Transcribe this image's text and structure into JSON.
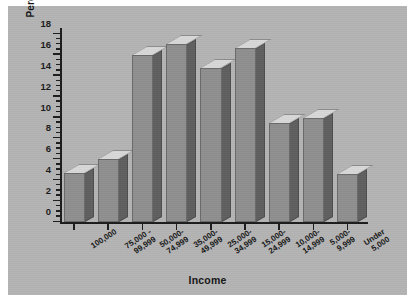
{
  "chart_data": {
    "type": "bar",
    "title": "",
    "xlabel": "Income",
    "ylabel": "Percent of Households",
    "ylim": [
      0,
      18
    ],
    "ytick_step": 2,
    "yticks": [
      0,
      2,
      4,
      6,
      8,
      10,
      12,
      14,
      16,
      18
    ],
    "minor_ticks": true,
    "grid": false,
    "legend": "none",
    "style": "3d-bar",
    "categories": [
      "100,000",
      "75,000 -\n99,999",
      "50,000-\n74,999",
      "35,000-\n49,999",
      "25,000-\n34,999",
      "15,000-\n24,999",
      "10,000-\n14,999",
      "5,000-\n9,999",
      "Under\n5,000"
    ],
    "category_lines": [
      [
        "100,000"
      ],
      [
        "75,000 -",
        "99,999"
      ],
      [
        "50,000-",
        "74,999"
      ],
      [
        "35,000-",
        "49,999"
      ],
      [
        "25,000-",
        "34,999"
      ],
      [
        "15,000-",
        "24,999"
      ],
      [
        "10,000-",
        "14,999"
      ],
      [
        "5,000-",
        "9,999"
      ],
      [
        "Under",
        "5,000"
      ]
    ],
    "values": [
      4.7,
      6.0,
      16.0,
      17.0,
      14.7,
      16.7,
      9.5,
      10.0,
      4.6
    ]
  },
  "colors": {
    "background": "#b4b4b4",
    "page": "#ffffff",
    "bar_face": "#8f8f8f",
    "bar_side": "#5f5f5f",
    "bar_top": "#d8d8d8",
    "axis": "#1c1c1c",
    "text": "#141414"
  },
  "axis": {
    "x_title": "Income",
    "y_title": "Percent of Households",
    "y_labels": [
      "18",
      "16",
      "14",
      "12",
      "10",
      "8",
      "6",
      "4",
      "2",
      "0"
    ]
  }
}
